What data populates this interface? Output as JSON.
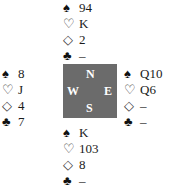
{
  "suits": {
    "spades": "♠",
    "hearts": "♡",
    "diamonds": "◇",
    "clubs": "♣"
  },
  "compass": {
    "north": "N",
    "south": "S",
    "east": "E",
    "west": "W",
    "background": "#6b6b6b"
  },
  "hands": {
    "north": {
      "spades": "94",
      "hearts": "K",
      "diamonds": "2",
      "clubs": "–"
    },
    "west": {
      "spades": "8",
      "hearts": "J",
      "diamonds": "4",
      "clubs": "7"
    },
    "east": {
      "spades": "Q10",
      "hearts": "Q6",
      "diamonds": "–",
      "clubs": "–"
    },
    "south": {
      "spades": "K",
      "hearts": "103",
      "diamonds": "8",
      "clubs": "–"
    }
  }
}
